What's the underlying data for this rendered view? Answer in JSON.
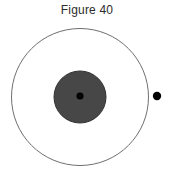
{
  "figure": {
    "title": "Figure 40",
    "background_color": "#ffffff"
  },
  "chart_data": {
    "type": "diagram",
    "title": "Figure 40",
    "subtitle": "",
    "xlabel": "",
    "ylabel": "",
    "grid": false,
    "legend": "none",
    "canvas": {
      "width": 174,
      "height": 183
    },
    "elements": [
      {
        "name": "orbit-circle",
        "shape": "circle",
        "cx": 80,
        "cy": 97,
        "r": 68.5,
        "fill": "none",
        "stroke": "#6f6f6f",
        "stroke_width": 1
      },
      {
        "name": "nucleus-disk",
        "shape": "circle",
        "cx": 80,
        "cy": 97,
        "r": 26,
        "fill": "#474747",
        "stroke": "#333333",
        "stroke_width": 1
      },
      {
        "name": "nucleus-center-point",
        "shape": "circle",
        "cx": 80,
        "cy": 96,
        "r": 3.6,
        "fill": "#000000",
        "stroke": "none",
        "stroke_width": 0
      },
      {
        "name": "orbiting-particle",
        "shape": "circle",
        "cx": 157,
        "cy": 96,
        "r": 4.2,
        "fill": "#000000",
        "stroke": "none",
        "stroke_width": 0
      }
    ]
  }
}
